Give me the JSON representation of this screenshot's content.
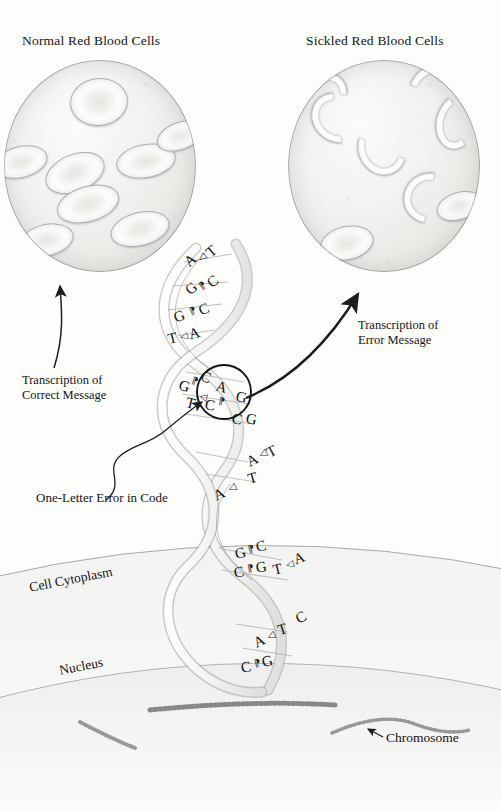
{
  "figure": {
    "domain": "biology-diagram",
    "ink_color": "#141414",
    "paper_color": "#fdfdfc"
  },
  "panels": {
    "normal": {
      "title": "Normal Red Blood Cells",
      "cell_shape": "biconcave-disc",
      "cell_count": 8
    },
    "sickled": {
      "title": "Sickled Red Blood Cells",
      "cell_shape": "crescent",
      "cell_count": 8
    }
  },
  "annotations": {
    "correct_message": "Transcription of\nCorrect Message",
    "error_message": "Transcription of\nError Message",
    "one_letter_error": "One-Letter Error in Code",
    "cell_cytoplasm": "Cell Cytoplasm",
    "nucleus": "Nucleus",
    "chromosome": "Chromosome"
  },
  "dna": {
    "label": "DNA double helix",
    "base_pairs": [
      {
        "index": 1,
        "left": "A",
        "right": "T",
        "mutated": false
      },
      {
        "index": 2,
        "left": "G",
        "right": "C",
        "mutated": false
      },
      {
        "index": 3,
        "left": "G",
        "right": "C",
        "mutated": false
      },
      {
        "index": 4,
        "left": "T",
        "right": "A",
        "mutated": false
      },
      {
        "index": 5,
        "left": "G",
        "right": "C",
        "mutated": false
      },
      {
        "index": 6,
        "left": "T",
        "right": "A",
        "mutated": true
      },
      {
        "index": 7,
        "left": "C",
        "right": "G",
        "mutated": false
      },
      {
        "index": 8,
        "left": "C",
        "right": "G",
        "mutated": false
      },
      {
        "index": 9,
        "left": "A",
        "right": "T",
        "mutated": false
      },
      {
        "index": 10,
        "left": "A",
        "right": "T",
        "mutated": false
      },
      {
        "index": 11,
        "left": "G",
        "right": "C",
        "mutated": false
      },
      {
        "index": 12,
        "left": "C",
        "right": "G",
        "mutated": false
      },
      {
        "index": 13,
        "left": "T",
        "right": "A",
        "mutated": false
      },
      {
        "index": 14,
        "left": "A",
        "right": "T",
        "mutated": false
      },
      {
        "index": 15,
        "left": "C",
        "right": "G",
        "mutated": false
      }
    ],
    "pair_tick": "⁃"
  },
  "bases": {
    "b1l": "A",
    "b1r": "T",
    "b2l": "G",
    "b2r": "C",
    "b3l": "G",
    "b3r": "C",
    "b4l": "T",
    "b4r": "A",
    "b5l": "G",
    "b5r": "C",
    "b6l": "T",
    "b6r": "A",
    "b7l": "C",
    "b7r": "G",
    "b8l": "C",
    "b8r": "G",
    "b9l": "A",
    "b9r": "T",
    "b10l": "A",
    "b10r": "T",
    "b11l": "G",
    "b11r": "C",
    "b12l": "C",
    "b12r": "G",
    "b13l": "T",
    "b13r": "A",
    "b14l": "A",
    "b14r": "T",
    "b15l": "C",
    "b15r": "G"
  },
  "cell": {
    "chromosome_count": 3,
    "nucleus_label": "Nucleus",
    "cytoplasm_label": "Cell Cytoplasm"
  }
}
